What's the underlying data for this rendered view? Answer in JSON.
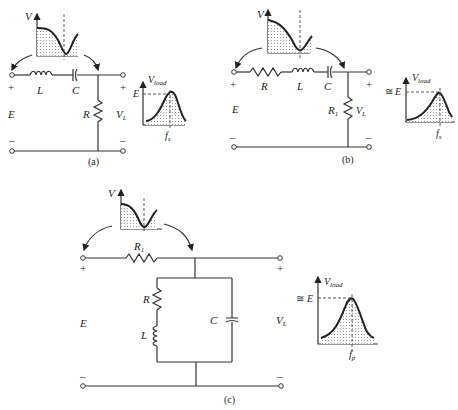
{
  "figure": {
    "circuits": [
      {
        "id": "a",
        "caption": "(a)",
        "source_label": "E",
        "plus": "+",
        "minus": "–",
        "components": [
          {
            "type": "inductor",
            "label": "L"
          },
          {
            "type": "capacitor",
            "label": "C"
          },
          {
            "type": "resistor",
            "label": "R"
          }
        ],
        "output_label": "V",
        "output_sub": "L",
        "input_spectrum_axis": "V",
        "response": {
          "ylabel": "V",
          "ylabel_sub": "load",
          "level": "E",
          "approx": "",
          "freq": "f",
          "freq_sub": "s"
        }
      },
      {
        "id": "b",
        "caption": "(b)",
        "source_label": "E",
        "plus": "+",
        "minus": "–",
        "components": [
          {
            "type": "resistor",
            "label": "R"
          },
          {
            "type": "inductor",
            "label": "L"
          },
          {
            "type": "capacitor",
            "label": "C"
          },
          {
            "type": "resistor",
            "label": "R",
            "sub": "1"
          }
        ],
        "output_label": "V",
        "output_sub": "L",
        "input_spectrum_axis": "V",
        "response": {
          "ylabel": "V",
          "ylabel_sub": "load",
          "level": "E",
          "approx": "≅",
          "freq": "f",
          "freq_sub": "s"
        }
      },
      {
        "id": "c",
        "caption": "(c)",
        "source_label": "E",
        "plus": "+",
        "minus": "–",
        "components": [
          {
            "type": "resistor",
            "label": "R",
            "sub": "1"
          },
          {
            "type": "resistor",
            "label": "R"
          },
          {
            "type": "inductor",
            "label": "L"
          },
          {
            "type": "capacitor",
            "label": "C"
          }
        ],
        "output_label": "V",
        "output_sub": "L",
        "input_spectrum_axis": "V",
        "response": {
          "ylabel": "V",
          "ylabel_sub": "load",
          "level": "E",
          "approx": "≅",
          "freq": "f",
          "freq_sub": "p"
        }
      }
    ]
  }
}
